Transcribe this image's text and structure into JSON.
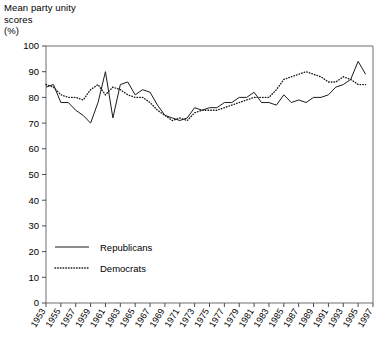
{
  "chart_data": {
    "type": "line",
    "title": "Mean party unity\nscores\n(%)",
    "ylabel": "Mean party unity scores (%)",
    "xlabel": "",
    "ylim": [
      0,
      100
    ],
    "yticks": [
      0,
      10,
      20,
      30,
      40,
      50,
      60,
      70,
      80,
      90,
      100
    ],
    "xlim": [
      1953,
      1997
    ],
    "xticks": [
      1953,
      1955,
      1957,
      1959,
      1961,
      1963,
      1965,
      1967,
      1969,
      1971,
      1973,
      1975,
      1977,
      1979,
      1981,
      1983,
      1985,
      1987,
      1989,
      1991,
      1993,
      1995,
      1997
    ],
    "xtick_labels": [
      "1953",
      "1955",
      "1957",
      "1959",
      "1961",
      "1963",
      "1965",
      "1967",
      "1969",
      "1971",
      "1973",
      "1975",
      "1977",
      "1979",
      "1981",
      "1983",
      "1985",
      "1987",
      "1989",
      "1991",
      "1993",
      "1995",
      "1997"
    ],
    "grid": false,
    "legend_position": "inside-lower-left",
    "x": [
      1953,
      1954,
      1955,
      1956,
      1957,
      1958,
      1959,
      1960,
      1961,
      1962,
      1963,
      1964,
      1965,
      1966,
      1967,
      1968,
      1969,
      1970,
      1971,
      1972,
      1973,
      1974,
      1975,
      1976,
      1977,
      1978,
      1979,
      1980,
      1981,
      1982,
      1983,
      1984,
      1985,
      1986,
      1987,
      1988,
      1989,
      1990,
      1991,
      1992,
      1993,
      1994,
      1995,
      1996
    ],
    "series": [
      {
        "name": "Republicans",
        "style": "solid",
        "color": "#1b1b1b",
        "values": [
          84,
          85,
          78,
          78,
          75,
          73,
          70,
          78,
          90,
          72,
          85,
          86,
          81,
          83,
          82,
          77,
          73,
          72,
          71,
          72,
          76,
          75,
          76,
          76,
          78,
          78,
          80,
          80,
          82,
          78,
          78,
          77,
          81,
          78,
          79,
          78,
          80,
          80,
          81,
          84,
          85,
          87,
          94,
          89
        ]
      },
      {
        "name": "Democrats",
        "style": "dotted",
        "color": "#1b1b1b",
        "values": [
          85,
          84,
          81,
          80,
          80,
          79,
          83,
          85,
          81,
          84,
          83,
          81,
          80,
          80,
          78,
          75,
          73,
          71,
          72,
          71,
          74,
          75,
          75,
          75,
          76,
          77,
          78,
          79,
          80,
          80,
          80,
          83,
          87,
          88,
          89,
          90,
          89,
          88,
          86,
          86,
          88,
          87,
          85,
          85
        ]
      }
    ],
    "legend": [
      {
        "label": "Republicans",
        "style": "solid"
      },
      {
        "label": "Democrats",
        "style": "dotted"
      }
    ]
  }
}
